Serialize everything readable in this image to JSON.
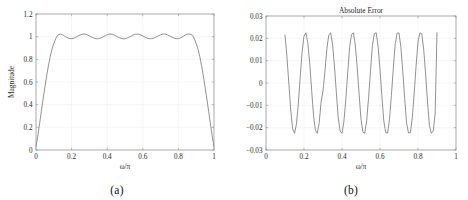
{
  "figure": {
    "width": 468,
    "height": 200,
    "background": "#ffffff",
    "curve_color": "#6e6e6e",
    "axis_color": "#8d8d8d",
    "grid_color": "#ededed"
  },
  "panels": [
    {
      "caption": "(a)",
      "title": "",
      "xlabel": "ω/π",
      "ylabel": "Magnitude",
      "xticks": [
        "0",
        "0.2",
        "0.4",
        "0.6",
        "0.8",
        "1"
      ],
      "yticks": [
        "0",
        "0.2",
        "0.4",
        "0.6",
        "0.8",
        "1",
        "1.2"
      ]
    },
    {
      "caption": "(b)",
      "title": "Absolute Error",
      "xlabel": "ω/π",
      "ylabel": "",
      "xticks": [
        "0",
        "0.2",
        "0.4",
        "0.6",
        "0.8",
        "1"
      ],
      "yticks": [
        "0.03",
        "0.02",
        "0.01",
        "0",
        "−0.01",
        "−0.02",
        "−0.03"
      ]
    }
  ],
  "chart_data": [
    {
      "type": "line",
      "panel": "(a)",
      "title": "",
      "xlabel": "ω/π",
      "ylabel": "Magnitude",
      "xlim": [
        0,
        1
      ],
      "ylim": [
        0,
        1.2
      ],
      "xticks": [
        0,
        0.2,
        0.4,
        0.6,
        0.8,
        1
      ],
      "yticks": [
        0,
        0.2,
        0.4,
        0.6,
        0.8,
        1,
        1.2
      ],
      "grid": true,
      "legend": "none",
      "series": [
        {
          "name": "Magnitude response",
          "x": [
            0.0,
            0.01,
            0.02,
            0.03,
            0.04,
            0.05,
            0.06,
            0.07,
            0.08,
            0.09,
            0.1,
            0.11,
            0.12,
            0.13,
            0.14,
            0.15,
            0.16,
            0.17,
            0.18,
            0.19,
            0.2,
            0.21,
            0.22,
            0.23,
            0.24,
            0.25,
            0.26,
            0.27,
            0.28,
            0.29,
            0.3,
            0.31,
            0.32,
            0.33,
            0.34,
            0.35,
            0.36,
            0.37,
            0.38,
            0.39,
            0.4,
            0.41,
            0.42,
            0.43,
            0.44,
            0.45,
            0.46,
            0.47,
            0.48,
            0.49,
            0.5,
            0.51,
            0.52,
            0.53,
            0.54,
            0.55,
            0.56,
            0.57,
            0.58,
            0.59,
            0.6,
            0.61,
            0.62,
            0.63,
            0.64,
            0.65,
            0.66,
            0.67,
            0.68,
            0.69,
            0.7,
            0.71,
            0.72,
            0.73,
            0.74,
            0.75,
            0.76,
            0.77,
            0.78,
            0.79,
            0.8,
            0.81,
            0.82,
            0.83,
            0.84,
            0.85,
            0.86,
            0.87,
            0.88,
            0.89,
            0.9,
            0.91,
            0.92,
            0.93,
            0.94,
            0.95,
            0.96,
            0.97,
            0.98,
            0.99,
            1.0
          ],
          "y": [
            0.03,
            0.12,
            0.23,
            0.34,
            0.45,
            0.555,
            0.655,
            0.745,
            0.825,
            0.89,
            0.94,
            0.98,
            1.01,
            1.021,
            1.022,
            1.016,
            1.006,
            0.996,
            0.988,
            0.983,
            0.982,
            0.985,
            0.992,
            1.0,
            1.009,
            1.017,
            1.022,
            1.023,
            1.021,
            1.015,
            1.007,
            0.999,
            0.991,
            0.985,
            0.982,
            0.982,
            0.986,
            0.993,
            1.001,
            1.01,
            1.017,
            1.022,
            1.023,
            1.02,
            1.014,
            1.006,
            0.997,
            0.989,
            0.984,
            0.981,
            0.982,
            0.986,
            0.993,
            1.001,
            1.01,
            1.017,
            1.022,
            1.023,
            1.02,
            1.014,
            1.006,
            0.997,
            0.989,
            0.984,
            0.982,
            0.982,
            0.986,
            0.993,
            1.001,
            1.01,
            1.017,
            1.022,
            1.023,
            1.021,
            1.015,
            1.007,
            0.999,
            0.991,
            0.985,
            0.982,
            0.983,
            0.988,
            0.996,
            1.006,
            1.016,
            1.022,
            1.022,
            1.021,
            1.01,
            0.98,
            0.94,
            0.89,
            0.825,
            0.745,
            0.655,
            0.555,
            0.45,
            0.34,
            0.23,
            0.12,
            0.03
          ]
        }
      ]
    },
    {
      "type": "line",
      "panel": "(b)",
      "title": "Absolute Error",
      "xlabel": "ω/π",
      "ylabel": "",
      "xlim": [
        0,
        1
      ],
      "ylim": [
        -0.03,
        0.03
      ],
      "xticks": [
        0,
        0.2,
        0.4,
        0.6,
        0.8,
        1
      ],
      "yticks": [
        -0.03,
        -0.02,
        -0.01,
        0,
        0.01,
        0.02,
        0.03
      ],
      "grid": true,
      "legend": "none",
      "notes": "Equiripple error shown only over passband 0.10 to 0.90; ripple amplitude about 0.0225",
      "series": [
        {
          "name": "Absolute error",
          "x": [
            0.1,
            0.11,
            0.12,
            0.13,
            0.14,
            0.15,
            0.16,
            0.17,
            0.18,
            0.19,
            0.2,
            0.21,
            0.22,
            0.23,
            0.24,
            0.25,
            0.26,
            0.27,
            0.28,
            0.29,
            0.3,
            0.31,
            0.32,
            0.33,
            0.34,
            0.35,
            0.36,
            0.37,
            0.38,
            0.39,
            0.4,
            0.41,
            0.42,
            0.43,
            0.44,
            0.45,
            0.46,
            0.47,
            0.48,
            0.49,
            0.5,
            0.51,
            0.52,
            0.53,
            0.54,
            0.55,
            0.56,
            0.57,
            0.58,
            0.59,
            0.6,
            0.61,
            0.62,
            0.63,
            0.64,
            0.65,
            0.66,
            0.67,
            0.68,
            0.69,
            0.7,
            0.71,
            0.72,
            0.73,
            0.74,
            0.75,
            0.76,
            0.77,
            0.78,
            0.79,
            0.8,
            0.81,
            0.82,
            0.83,
            0.84,
            0.85,
            0.86,
            0.87,
            0.88,
            0.89,
            0.9
          ],
          "y": [
            0.0215,
            0.012,
            0.0,
            -0.012,
            -0.0205,
            -0.0225,
            -0.0185,
            -0.0095,
            0.0025,
            0.014,
            0.021,
            0.0225,
            0.018,
            0.009,
            -0.003,
            -0.0145,
            -0.0212,
            -0.0225,
            -0.0178,
            -0.0085,
            -0.0035,
            0.005,
            0.015,
            0.0213,
            0.0225,
            0.0175,
            0.008,
            -0.004,
            -0.0155,
            -0.0215,
            -0.0225,
            -0.0172,
            -0.0075,
            0.0045,
            0.016,
            0.0217,
            0.0225,
            0.017,
            0.007,
            -0.005,
            -0.0163,
            -0.022,
            -0.0225,
            -0.0168,
            -0.0065,
            0.0055,
            0.0168,
            0.0221,
            0.0225,
            0.0165,
            0.006,
            -0.006,
            -0.017,
            -0.0222,
            -0.0224,
            -0.0162,
            -0.0055,
            0.0065,
            0.0175,
            0.0223,
            0.0224,
            0.016,
            0.005,
            -0.007,
            -0.018,
            -0.0224,
            -0.0222,
            -0.0155,
            -0.0045,
            0.0078,
            0.0185,
            0.0225,
            0.022,
            0.015,
            0.004,
            -0.0085,
            -0.019,
            -0.0225,
            -0.0215,
            -0.014,
            0.0225
          ]
        }
      ]
    }
  ]
}
